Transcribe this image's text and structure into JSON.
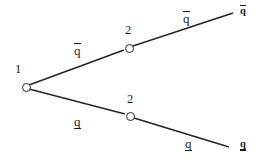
{
  "diagram": {
    "stroke_color": "#242424",
    "text_color": "#1c1c1c",
    "background": "#ffffff",
    "nodes": [
      {
        "id": "root",
        "label": "1",
        "x": 22,
        "y": 84
      },
      {
        "id": "upper-branch",
        "label": "2",
        "x": 125,
        "y": 45
      },
      {
        "id": "lower-branch",
        "label": "2",
        "x": 126,
        "y": 113
      }
    ],
    "edge_labels": [
      {
        "id": "root-to-upper",
        "text": "q",
        "decoration": "overline"
      },
      {
        "id": "upper-to-end",
        "text": "q",
        "decoration": "overline"
      },
      {
        "id": "root-to-lower",
        "text": "q",
        "decoration": "underline"
      },
      {
        "id": "lower-to-end",
        "text": "q",
        "decoration": "underline"
      }
    ],
    "end_labels": [
      {
        "id": "upper-endpoint",
        "text": "q",
        "decoration": "overline"
      },
      {
        "id": "lower-endpoint",
        "text": "q",
        "decoration": "underline"
      }
    ]
  }
}
